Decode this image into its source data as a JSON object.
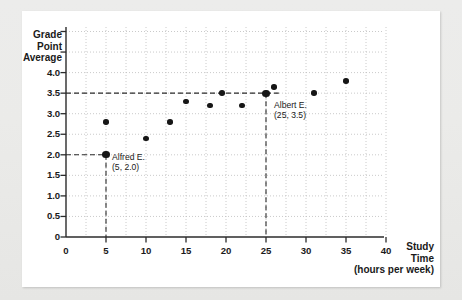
{
  "figure": {
    "background_color": "#ffffff",
    "surround_color": "#e9e9e7",
    "axis_color": "#2b2b2b",
    "grid_color": "#bdbdbd",
    "point_color": "#161616"
  },
  "axis": {
    "y_title_lines": [
      "Grade",
      "Point",
      "Average"
    ],
    "y_ticks": [
      "4.0",
      "3.5",
      "3.0",
      "2.5",
      "2.0",
      "1.5",
      "1.0",
      "0.5",
      "0"
    ],
    "y_tick_values": [
      4.0,
      3.5,
      3.0,
      2.5,
      2.0,
      1.5,
      1.0,
      0.5,
      0
    ],
    "y_unlabeled_ticks": [
      5.0,
      4.5
    ],
    "x_ticks": [
      "0",
      "5",
      "10",
      "15",
      "20",
      "25",
      "30",
      "35",
      "40"
    ],
    "x_tick_values": [
      0,
      5,
      10,
      15,
      20,
      25,
      30,
      35,
      40
    ],
    "x_title_lines": [
      "Study",
      "Time",
      "(hours per week)"
    ]
  },
  "annotations": [
    {
      "id": "alfred",
      "name_label": "Alfred E.",
      "coord_label": "(5, 2.0)",
      "x": 5,
      "y": 2.0
    },
    {
      "id": "albert",
      "name_label": "Albert E.",
      "coord_label": "(25, 3.5)",
      "x": 25,
      "y": 3.5
    }
  ],
  "chart_data": {
    "type": "scatter",
    "title": "",
    "xlabel": "Study Time (hours per week)",
    "ylabel": "Grade Point Average",
    "xlim": [
      0,
      42
    ],
    "ylim": [
      0,
      5.0
    ],
    "grid": true,
    "legend": "none",
    "x": [
      5,
      5,
      10,
      13,
      15,
      18,
      19.5,
      22,
      25,
      26,
      31,
      35
    ],
    "y": [
      2.0,
      2.8,
      2.4,
      2.8,
      3.3,
      3.2,
      3.5,
      3.2,
      3.5,
      3.65,
      3.5,
      3.8
    ],
    "points": [
      {
        "x": 5,
        "y": 2.0,
        "label": "Alfred E.",
        "highlighted": true
      },
      {
        "x": 5,
        "y": 2.8,
        "label": "",
        "highlighted": false
      },
      {
        "x": 10,
        "y": 2.4,
        "label": "",
        "highlighted": false
      },
      {
        "x": 13,
        "y": 2.8,
        "label": "",
        "highlighted": false
      },
      {
        "x": 15,
        "y": 3.3,
        "label": "",
        "highlighted": false
      },
      {
        "x": 18,
        "y": 3.2,
        "label": "",
        "highlighted": false
      },
      {
        "x": 19.5,
        "y": 3.5,
        "label": "",
        "highlighted": false
      },
      {
        "x": 22,
        "y": 3.2,
        "label": "",
        "highlighted": false
      },
      {
        "x": 25,
        "y": 3.5,
        "label": "Albert E.",
        "highlighted": true
      },
      {
        "x": 26,
        "y": 3.65,
        "label": "",
        "highlighted": false
      },
      {
        "x": 31,
        "y": 3.5,
        "label": "",
        "highlighted": false
      },
      {
        "x": 35,
        "y": 3.8,
        "label": "",
        "highlighted": false
      }
    ],
    "guide_lines": [
      {
        "orientation": "horizontal",
        "value": 3.5,
        "style": "dashed"
      },
      {
        "orientation": "horizontal",
        "value": 2.0,
        "style": "dashed"
      },
      {
        "orientation": "vertical",
        "value": 5,
        "style": "dashed"
      },
      {
        "orientation": "vertical",
        "value": 25,
        "style": "dashed"
      }
    ],
    "annotations": [
      {
        "text": "Alfred E.",
        "x": 5,
        "y": 2.0
      },
      {
        "text": "(5, 2.0)",
        "x": 5,
        "y": 2.0
      },
      {
        "text": "Albert E.",
        "x": 25,
        "y": 3.5
      },
      {
        "text": "(25, 3.5)",
        "x": 25,
        "y": 3.5
      }
    ]
  }
}
